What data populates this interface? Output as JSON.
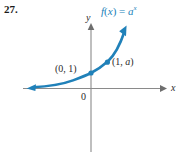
{
  "figure": {
    "problem_number": "27.",
    "background_color": "#ffffff",
    "curve_color": "#2081b9",
    "axis_color": "#7a7a7a",
    "text_color": "#2a2a2a",
    "axes": {
      "x_axis_label": "x",
      "y_axis_label": "y",
      "origin_label": "0",
      "x_arrow_direction": "right",
      "y_arrow_direction": "up"
    },
    "function_label": {
      "full_text": "f(x) = aˣ",
      "f_name": "f",
      "open_paren": "(",
      "variable": "x",
      "close_paren": ")",
      "equals": " = ",
      "base": "a",
      "exponent": "x"
    },
    "points": [
      {
        "label": "(0, 1)",
        "coord_x": 0,
        "coord_y": 1,
        "label_left": 55,
        "label_top": 64,
        "dot_x": 91,
        "dot_y": 73
      },
      {
        "label": "(1, a)",
        "coord_x": 1,
        "coord_y": "a",
        "label_left": 112,
        "label_top": 57,
        "dot_x": 107,
        "dot_y": 62
      }
    ]
  },
  "chart_data": {
    "type": "line",
    "title": "",
    "subtitle": "",
    "xlabel": "x",
    "ylabel": "y",
    "legend": [
      "f(x) = a^x"
    ],
    "legend_position": "top-right",
    "grid": false,
    "xlim": [
      -4.2,
      2.2
    ],
    "ylim": [
      -1.6,
      3.4
    ],
    "annotations": [
      {
        "text": "(0, 1)",
        "x": 0,
        "y": 1
      },
      {
        "text": "(1, a)",
        "x": 1,
        "y": 2.0
      },
      {
        "text": "f(x) = a^x",
        "x": 1.35,
        "y": 3.25
      },
      {
        "text": "0",
        "x": -0.18,
        "y": -0.28
      }
    ],
    "series": [
      {
        "name": "f(x) = a^x",
        "color": "#2081b9",
        "x": [
          -4.2,
          -3.6,
          -3.0,
          -2.4,
          -1.8,
          -1.2,
          -0.6,
          0.0,
          0.4,
          0.8,
          1.0,
          1.3,
          1.6
        ],
        "values": [
          0.05,
          0.08,
          0.12,
          0.19,
          0.29,
          0.45,
          0.69,
          1.0,
          1.32,
          1.74,
          2.0,
          2.46,
          3.03
        ],
        "arrow_start": true,
        "arrow_end": true,
        "markers": [
          {
            "x": 0,
            "y": 1
          },
          {
            "x": 1,
            "y": 2.0
          }
        ]
      }
    ]
  }
}
